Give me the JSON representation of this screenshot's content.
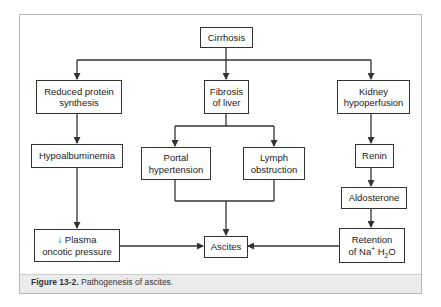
{
  "diagram": {
    "nodes": {
      "cirrhosis": {
        "line1": "Cirrhosis"
      },
      "reduced_protein": {
        "line1": "Reduced protein",
        "line2": "synthesis"
      },
      "fibrosis": {
        "line1": "Fibrosis",
        "line2": "of liver"
      },
      "kidney": {
        "line1": "Kidney",
        "line2": "hypoperfusion"
      },
      "hypoalbuminemia": {
        "line1": "Hypoalbuminemia"
      },
      "portal": {
        "line1": "Portal",
        "line2": "hypertension"
      },
      "lymph": {
        "line1": "Lymph",
        "line2": "obstruction"
      },
      "renin": {
        "line1": "Renin"
      },
      "aldosterone": {
        "line1": "Aldosterone"
      },
      "plasma": {
        "line1": "↓ Plasma",
        "line2": "oncotic pressure"
      },
      "ascites": {
        "line1": "Ascites"
      },
      "retention": {
        "line1": "Retention",
        "line2_prefix": "of Na",
        "line2_sup": "+",
        "line2_mid": " H",
        "line2_sub": "2",
        "line2_suffix": "O"
      }
    },
    "edges": [
      {
        "from": "Cirrhosis",
        "to": "Reduced protein synthesis"
      },
      {
        "from": "Cirrhosis",
        "to": "Fibrosis of liver"
      },
      {
        "from": "Cirrhosis",
        "to": "Kidney hypoperfusion"
      },
      {
        "from": "Reduced protein synthesis",
        "to": "Hypoalbuminemia"
      },
      {
        "from": "Hypoalbuminemia",
        "to": "↓ Plasma oncotic pressure"
      },
      {
        "from": "Fibrosis of liver",
        "to": "Portal hypertension"
      },
      {
        "from": "Fibrosis of liver",
        "to": "Lymph obstruction"
      },
      {
        "from": "Portal hypertension",
        "to": "Ascites"
      },
      {
        "from": "Lymph obstruction",
        "to": "Ascites"
      },
      {
        "from": "Kidney hypoperfusion",
        "to": "Renin"
      },
      {
        "from": "Renin",
        "to": "Aldosterone"
      },
      {
        "from": "Aldosterone",
        "to": "Retention of Na+ H2O"
      },
      {
        "from": "↓ Plasma oncotic pressure",
        "to": "Ascites"
      },
      {
        "from": "Retention of Na+ H2O",
        "to": "Ascites"
      }
    ],
    "colors": {
      "line": "#333333",
      "frame": "#b8b8b8",
      "caption_band": "#ececec"
    }
  },
  "caption": {
    "label": "Figure 13-2.",
    "text": " Pathogenesis of ascites."
  }
}
